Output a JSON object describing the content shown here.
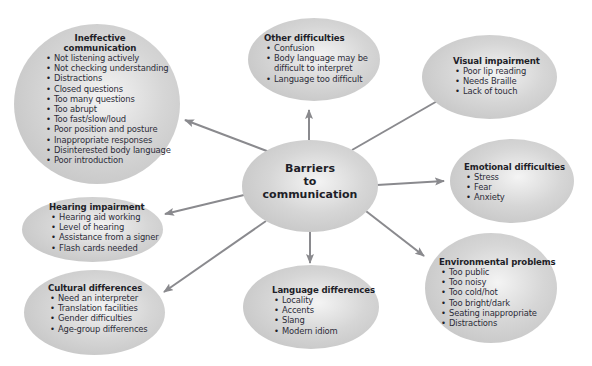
{
  "diagram": {
    "center": {
      "line1": "Barriers",
      "line2": "to",
      "line3": "communication"
    },
    "nodes": {
      "ineffective": {
        "title_line1": "Ineffective",
        "title_line2": "communication",
        "items": [
          "Not listening actively",
          "Not checking understanding",
          "Distractions",
          "Closed questions",
          "Too many questions",
          "Too abrupt",
          "Too fast/slow/loud",
          "Poor position and posture",
          "Inappropriate responses",
          "Disinterested body language",
          "Poor introduction"
        ]
      },
      "other": {
        "title": "Other difficulties",
        "items": [
          "Confusion",
          "Body language may be",
          "difficult to interpret",
          "Language too difficult"
        ]
      },
      "visual": {
        "title": "Visual impairment",
        "items": [
          "Poor lip reading",
          "Needs Braille",
          "Lack of touch"
        ]
      },
      "emotional": {
        "title": "Emotional difficulties",
        "items": [
          "Stress",
          "Fear",
          "Anxiety"
        ]
      },
      "environmental": {
        "title": "Environmental problems",
        "items": [
          "Too public",
          "Too noisy",
          "Too cold/hot",
          "Too bright/dark",
          "Seating inappropriate",
          "Distractions"
        ]
      },
      "language": {
        "title": "Language differences",
        "items": [
          "Locality",
          "Accents",
          "Slang",
          "Modern idiom"
        ]
      },
      "cultural": {
        "title": "Cultural differences",
        "items": [
          "Need an interpreter",
          "Translation facilities",
          "Gender difficulties",
          "Age-group differences"
        ]
      },
      "hearing": {
        "title": "Hearing impairment",
        "items": [
          "Hearing aid working",
          "Level of hearing",
          "Assistance from a signer",
          "Flash cards needed"
        ]
      }
    },
    "colors": {
      "arrow": "#8a8a8e",
      "bubble_light": "#f4f4f4",
      "bubble_dark": "#bdbdbd",
      "text": "#1e1e28"
    }
  }
}
